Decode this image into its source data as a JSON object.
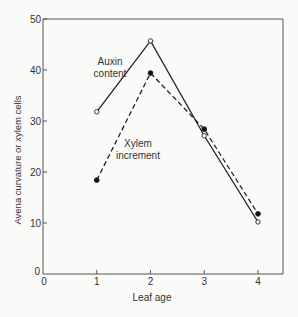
{
  "chart_data": {
    "type": "line",
    "title": "",
    "xlabel": "Leaf age",
    "ylabel": "Avena curvature or xylem cells",
    "x": [
      1,
      2,
      3,
      4
    ],
    "xlim": [
      0,
      4.5
    ],
    "ylim": [
      0,
      50
    ],
    "x_ticks": [
      "0",
      "1",
      "2",
      "3",
      "4"
    ],
    "y_ticks": [
      "0",
      "10",
      "20",
      "30",
      "40",
      "50"
    ],
    "grid": false,
    "legend": "inline annotations",
    "series": [
      {
        "name": "Auxin content",
        "line_style": "solid",
        "marker": "open-circle",
        "values": [
          31.8,
          45.7,
          27.1,
          10.2
        ]
      },
      {
        "name": "Xylem increment",
        "line_style": "dashed",
        "marker": "filled-circle",
        "values": [
          18.4,
          39.4,
          28.4,
          11.8
        ]
      }
    ],
    "annotations": [
      {
        "text_line1": "Auxin",
        "text_line2": "content",
        "series": "Auxin content"
      },
      {
        "text_line1": "Xylem",
        "text_line2": "increment",
        "series": "Xylem increment"
      }
    ]
  }
}
